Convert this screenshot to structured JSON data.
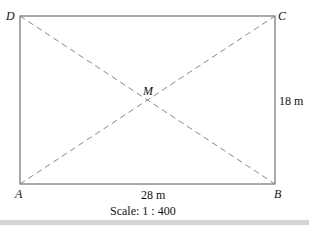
{
  "diagram": {
    "vertices": {
      "A": "A",
      "B": "B",
      "C": "C",
      "D": "D",
      "M": "M"
    },
    "dimensions": {
      "width": "28 m",
      "height": "18 m"
    },
    "scale": "Scale: 1 : 400",
    "colors": {
      "line": "#555555",
      "dash": "#888888",
      "footer": "#d4d4d4"
    }
  }
}
